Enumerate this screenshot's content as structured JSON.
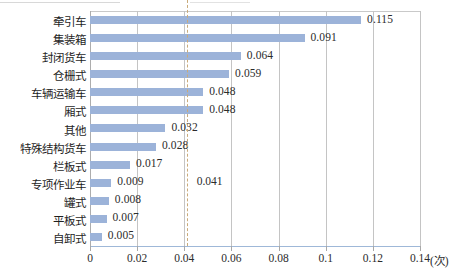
{
  "chart_data": {
    "type": "bar",
    "orientation": "horizontal",
    "title": "",
    "subtitle": "",
    "xlabel": "",
    "ylabel": "",
    "unit_label": "(次)",
    "xlim": [
      0,
      0.14
    ],
    "xticks": [
      "0",
      "0.02",
      "0.04",
      "0.06",
      "0.08",
      "0.1",
      "0.12",
      "0.14"
    ],
    "xtick_values": [
      0,
      0.02,
      0.04,
      0.06,
      0.08,
      0.1,
      0.12,
      0.14
    ],
    "grid": true,
    "legend": false,
    "bar_color": "#9cb3d9",
    "reference_line": {
      "value": 0.041,
      "label": "0.041",
      "color": "#c9ab7a",
      "style": "dashed"
    },
    "categories": [
      "牵引车",
      "集装箱",
      "封闭货车",
      "仓栅式",
      "车辆运输车",
      "厢式",
      "其他",
      "特殊结构货车",
      "栏板式",
      "专项作业车",
      "罐式",
      "平板式",
      "自卸式"
    ],
    "values": [
      0.115,
      0.091,
      0.064,
      0.059,
      0.048,
      0.048,
      0.032,
      0.028,
      0.017,
      0.009,
      0.008,
      0.007,
      0.005
    ],
    "value_labels": [
      "0.115",
      "0.091",
      "0.064",
      "0.059",
      "0.048",
      "0.048",
      "0.032",
      "0.028",
      "0.017",
      "0.009",
      "0.008",
      "0.007",
      "0.005"
    ]
  }
}
